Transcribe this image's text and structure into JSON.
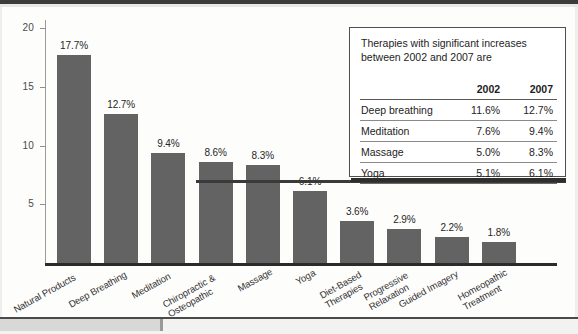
{
  "chart_data": {
    "type": "bar",
    "title": "",
    "xlabel": "",
    "ylabel": "",
    "ylim": [
      0,
      20.8
    ],
    "grid": false,
    "legend_position": "none",
    "yticks": [
      5,
      10,
      15,
      20
    ],
    "ytick_labels": [
      "5",
      "10",
      "15",
      "20"
    ],
    "categories": [
      "Natural Products",
      "Deep Breathing",
      "Meditation",
      "Chiropractic &\nOsteopathic",
      "Massage",
      "Yoga",
      "Diet-Based\nTherapies",
      "Progressive\nRelaxation",
      "Guided Imagery",
      "Homeopathic\nTreatment"
    ],
    "values": [
      17.7,
      12.7,
      9.4,
      8.6,
      8.3,
      6.1,
      3.6,
      2.9,
      2.2,
      1.8
    ],
    "value_labels": [
      "17.7%",
      "12.7%",
      "9.4%",
      "8.6%",
      "8.3%",
      "6.1%",
      "3.6%",
      "2.9%",
      "2.2%",
      "1.8%"
    ],
    "bar_color": "#636363",
    "axis_color": "#2b2b2b"
  },
  "panel": {
    "title": "Therapies with significant increases between 2002 and 2007 are",
    "columns": [
      "",
      "2002",
      "2007"
    ],
    "rows": [
      {
        "name": "Deep breathing",
        "y2002": "11.6%",
        "y2007": "12.7%"
      },
      {
        "name": "Meditation",
        "y2002": "7.6%",
        "y2007": "9.4%"
      },
      {
        "name": "Massage",
        "y2002": "5.0%",
        "y2007": "8.3%"
      },
      {
        "name": "Yoga",
        "y2002": "5.1%",
        "y2007": "6.1%"
      }
    ]
  }
}
